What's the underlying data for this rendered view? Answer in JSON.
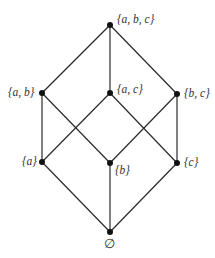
{
  "diagram": {
    "nodes": [
      {
        "id": "abc",
        "label": "{a, b, c}",
        "x": 110,
        "y": 25
      },
      {
        "id": "ab",
        "label": "{a, b}",
        "x": 42,
        "y": 93
      },
      {
        "id": "ac",
        "label": "{a, c}",
        "x": 110,
        "y": 93
      },
      {
        "id": "bc",
        "label": "{b, c}",
        "x": 177,
        "y": 94
      },
      {
        "id": "a",
        "label": "{a}",
        "x": 42,
        "y": 162
      },
      {
        "id": "b",
        "label": "{b}",
        "x": 110,
        "y": 163
      },
      {
        "id": "c",
        "label": "{c}",
        "x": 177,
        "y": 163
      },
      {
        "id": "empty",
        "label": "∅",
        "x": 110,
        "y": 232
      }
    ],
    "edges": [
      [
        "abc",
        "ab"
      ],
      [
        "abc",
        "ac"
      ],
      [
        "abc",
        "bc"
      ],
      [
        "ab",
        "a"
      ],
      [
        "ab",
        "b"
      ],
      [
        "ac",
        "a"
      ],
      [
        "ac",
        "c"
      ],
      [
        "bc",
        "b"
      ],
      [
        "bc",
        "c"
      ],
      [
        "a",
        "empty"
      ],
      [
        "b",
        "empty"
      ],
      [
        "c",
        "empty"
      ]
    ],
    "colors": {
      "line": "#2a2a2a",
      "node": "#111111",
      "text": "#333333"
    }
  }
}
